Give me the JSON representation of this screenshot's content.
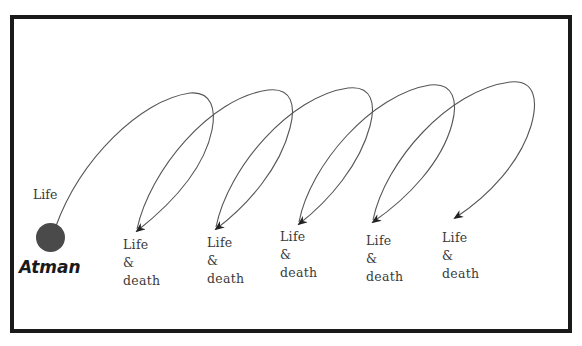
{
  "diagram": {
    "type": "cycle-of-rebirth",
    "origin": {
      "label": "Atman",
      "outgoing_label": "Life",
      "color": "#4a4a4a"
    },
    "stages": [
      {
        "line1": "Life",
        "line2": "&",
        "line3": "death"
      },
      {
        "line1": "Life",
        "line2": "&",
        "line3": "death"
      },
      {
        "line1": "Life",
        "line2": "&",
        "line3": "death"
      },
      {
        "line1": "Life",
        "line2": "&",
        "line3": "death"
      },
      {
        "line1": "Life",
        "line2": "&",
        "line3": "death"
      }
    ],
    "edges": [
      {
        "from": "Atman",
        "to": "stage-1"
      },
      {
        "from": "stage-1",
        "to": "stage-2"
      },
      {
        "from": "stage-2",
        "to": "stage-3"
      },
      {
        "from": "stage-3",
        "to": "stage-4"
      },
      {
        "from": "stage-4",
        "to": "stage-5"
      }
    ],
    "colors": {
      "border": "#1a1a1a",
      "line": "#555555",
      "text": "#3a3a3a"
    }
  }
}
